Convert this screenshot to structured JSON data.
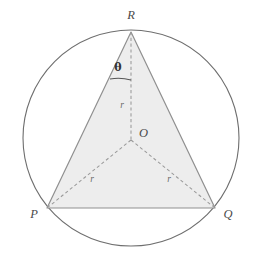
{
  "figure": {
    "type": "geometry-diagram"
  },
  "colors": {
    "background": "#ffffff",
    "circle_stroke": "#6e6e6e",
    "triangle_fill": "#ededed",
    "triangle_stroke": "#909090",
    "dashed_stroke": "#9a9a9a",
    "label_color": "#4a4a4a",
    "theta_color": "#333333",
    "radius_label_color": "#6a6a6a",
    "arc_stroke": "#555555"
  },
  "circle": {
    "center_x": 131,
    "center_y": 138,
    "radius": 108,
    "stroke_width": 1.1
  },
  "vertices": {
    "R": {
      "label": "R",
      "x": 131,
      "y": 32,
      "label_x": 131,
      "label_y": 19
    },
    "P": {
      "label": "P",
      "x": 47,
      "y": 208,
      "label_x": 34,
      "label_y": 218
    },
    "Q": {
      "label": "Q",
      "x": 215,
      "y": 208,
      "label_x": 228,
      "label_y": 218
    },
    "O": {
      "label": "O",
      "x": 131,
      "y": 140,
      "label_x": 139,
      "label_y": 137
    }
  },
  "radii_labels": [
    {
      "name": "radius-label-top",
      "text": "r",
      "x": 122,
      "y": 108
    },
    {
      "name": "radius-label-left",
      "text": "r",
      "x": 92,
      "y": 182
    },
    {
      "name": "radius-label-right",
      "text": "r",
      "x": 169,
      "y": 182
    }
  ],
  "angle": {
    "symbol": "θ",
    "label_x": 118,
    "label_y": 71,
    "arc_start_x": 110,
    "arc_start_y": 79,
    "arc_end_x": 131,
    "arc_end_y": 80,
    "arc_sweep_radius": 48
  },
  "geometry_data": {
    "type": "diagram",
    "shape": "equilateral-triangle-inscribed-in-circle",
    "circumradius_symbol": "r",
    "apex_half_angle_symbol": "θ",
    "segments": [
      {
        "from": "P",
        "to": "Q",
        "style": "solid",
        "name": "base-PQ"
      },
      {
        "from": "Q",
        "to": "R",
        "style": "solid",
        "name": "side-QR"
      },
      {
        "from": "R",
        "to": "P",
        "style": "solid",
        "name": "side-RP"
      },
      {
        "from": "O",
        "to": "R",
        "style": "dashed",
        "name": "radius-OR",
        "label": "r"
      },
      {
        "from": "O",
        "to": "P",
        "style": "dashed",
        "name": "radius-OP",
        "label": "r"
      },
      {
        "from": "O",
        "to": "Q",
        "style": "dashed",
        "name": "radius-OQ",
        "label": "r"
      }
    ],
    "labels": [
      "R",
      "P",
      "Q",
      "O",
      "r",
      "r",
      "r",
      "θ"
    ]
  }
}
